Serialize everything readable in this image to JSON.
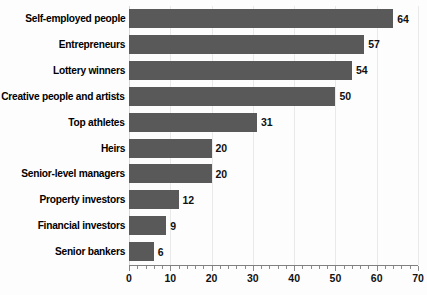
{
  "chart_data": {
    "type": "bar",
    "orientation": "horizontal",
    "title": "",
    "xlabel": "",
    "ylabel": "",
    "xlim": [
      0,
      70
    ],
    "ylim": null,
    "grid": true,
    "legend": false,
    "xticks": [
      0,
      10,
      20,
      30,
      40,
      50,
      60,
      70
    ],
    "xtick_labels": [
      "0",
      "10",
      "20",
      "30",
      "40",
      "50",
      "60",
      "70"
    ],
    "minor_tick_step": 2,
    "categories": [
      "Self-employed people",
      "Entrepreneurs",
      "Lottery winners",
      "Creative people and artists",
      "Top athletes",
      "Heirs",
      "Senior-level managers",
      "Property investors",
      "Financial investors",
      "Senior bankers"
    ],
    "values": [
      64,
      57,
      54,
      50,
      31,
      20,
      20,
      12,
      9,
      6
    ],
    "value_labels": [
      "64",
      "57",
      "54",
      "50",
      "31",
      "20",
      "20",
      "12",
      "9",
      "6"
    ],
    "colors": {
      "bar": "#59595a",
      "grid": "#e9e9e9",
      "axis": "#808080",
      "text": "#000000",
      "background": "#fdfdfd"
    }
  }
}
